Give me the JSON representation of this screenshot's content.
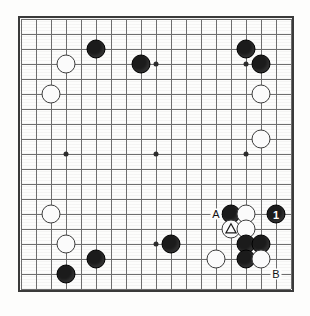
{
  "diagram": {
    "type": "go-board",
    "board_size": 19,
    "visible_columns": 19,
    "visible_rows": 19,
    "grid_spacing_px": 15,
    "colors": {
      "black_stone": "#1b1b1b",
      "white_stone": "#fbfbfb",
      "grid_line": "#6e6e6e",
      "border": "#3a3a3a",
      "background": "#fdfdfc",
      "label_text": "#111111"
    },
    "star_points": [
      {
        "col": 3,
        "row": 3
      },
      {
        "col": 9,
        "row": 3
      },
      {
        "col": 15,
        "row": 3
      },
      {
        "col": 3,
        "row": 9
      },
      {
        "col": 9,
        "row": 9
      },
      {
        "col": 15,
        "row": 9
      },
      {
        "col": 3,
        "row": 15
      },
      {
        "col": 9,
        "row": 15
      },
      {
        "col": 15,
        "row": 15
      }
    ],
    "stones": [
      {
        "col": 5,
        "row": 2,
        "color": "black",
        "label": ""
      },
      {
        "col": 8,
        "row": 3,
        "color": "black",
        "label": ""
      },
      {
        "col": 15,
        "row": 2,
        "color": "black",
        "label": ""
      },
      {
        "col": 16,
        "row": 3,
        "color": "black",
        "label": ""
      },
      {
        "col": 3,
        "row": 3,
        "color": "white",
        "label": ""
      },
      {
        "col": 2,
        "row": 5,
        "color": "white",
        "label": ""
      },
      {
        "col": 16,
        "row": 5,
        "color": "white",
        "label": ""
      },
      {
        "col": 16,
        "row": 8,
        "color": "white",
        "label": ""
      },
      {
        "col": 2,
        "row": 13,
        "color": "white",
        "label": ""
      },
      {
        "col": 14,
        "row": 13,
        "color": "black",
        "label": ""
      },
      {
        "col": 15,
        "row": 13,
        "color": "white",
        "label": ""
      },
      {
        "col": 17,
        "row": 13,
        "color": "black",
        "label": "1"
      },
      {
        "col": 14,
        "row": 14,
        "color": "white",
        "label": "",
        "mark": "triangle"
      },
      {
        "col": 15,
        "row": 14,
        "color": "white",
        "label": ""
      },
      {
        "col": 3,
        "row": 15,
        "color": "white",
        "label": ""
      },
      {
        "col": 10,
        "row": 15,
        "color": "black",
        "label": ""
      },
      {
        "col": 15,
        "row": 15,
        "color": "black",
        "label": ""
      },
      {
        "col": 16,
        "row": 15,
        "color": "black",
        "label": ""
      },
      {
        "col": 5,
        "row": 16,
        "color": "black",
        "label": ""
      },
      {
        "col": 13,
        "row": 16,
        "color": "white",
        "label": ""
      },
      {
        "col": 15,
        "row": 16,
        "color": "black",
        "label": ""
      },
      {
        "col": 16,
        "row": 16,
        "color": "white",
        "label": ""
      },
      {
        "col": 3,
        "row": 17,
        "color": "black",
        "label": ""
      }
    ],
    "point_labels": [
      {
        "col": 13,
        "row": 13,
        "text": "A"
      },
      {
        "col": 17,
        "row": 17,
        "text": "B"
      }
    ]
  }
}
